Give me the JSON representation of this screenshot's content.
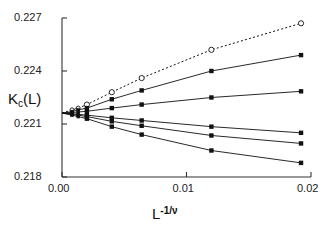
{
  "chart_data": {
    "type": "line",
    "title": "",
    "xlabel": "L^-1/nu",
    "ylabel": "Kc(L)",
    "xlim": [
      0.0,
      0.02
    ],
    "ylim": [
      0.218,
      0.227
    ],
    "xticks": [
      "0.00",
      "0.01",
      "0.02"
    ],
    "xtick_values": [
      0.0,
      0.01,
      0.02
    ],
    "yticks": [
      "0.218",
      "0.221",
      "0.224",
      "0.227"
    ],
    "ytick_values": [
      0.218,
      0.221,
      0.224,
      0.227
    ],
    "grid": false,
    "legend": "none",
    "series": [
      {
        "name": "series-1-dashed-open-circles",
        "marker": "open-circle",
        "linestyle": "dashed",
        "x": [
          0.0008,
          0.0013,
          0.002,
          0.004,
          0.0064,
          0.012,
          0.0192
        ],
        "y": [
          0.2218,
          0.2219,
          0.2221,
          0.2228,
          0.2236,
          0.2252,
          0.2267
        ]
      },
      {
        "name": "series-2-solid-filled-square",
        "marker": "filled-square",
        "linestyle": "solid",
        "x": [
          0.0008,
          0.0013,
          0.002,
          0.004,
          0.0064,
          0.012,
          0.0192
        ],
        "y": [
          0.2217,
          0.2218,
          0.2219,
          0.2224,
          0.2229,
          0.224,
          0.2249
        ]
      },
      {
        "name": "series-3-solid-filled-square",
        "marker": "filled-square",
        "linestyle": "solid",
        "x": [
          0.0008,
          0.0013,
          0.002,
          0.004,
          0.0064,
          0.012,
          0.0192
        ],
        "y": [
          0.22165,
          0.22168,
          0.22172,
          0.2219,
          0.2221,
          0.2225,
          0.22285
        ]
      },
      {
        "name": "series-4-solid-filled-square",
        "marker": "filled-square",
        "linestyle": "solid",
        "x": [
          0.0008,
          0.0013,
          0.002,
          0.004,
          0.0064,
          0.012,
          0.0192
        ],
        "y": [
          0.22158,
          0.22155,
          0.2215,
          0.22135,
          0.2212,
          0.22085,
          0.2205
        ]
      },
      {
        "name": "series-5-solid-filled-square",
        "marker": "filled-square",
        "linestyle": "solid",
        "x": [
          0.0008,
          0.0013,
          0.002,
          0.004,
          0.0064,
          0.012,
          0.0192
        ],
        "y": [
          0.22155,
          0.2215,
          0.22142,
          0.22115,
          0.2209,
          0.22035,
          0.2199
        ]
      },
      {
        "name": "series-6-solid-filled-square",
        "marker": "filled-square",
        "linestyle": "solid",
        "x": [
          0.0008,
          0.0013,
          0.002,
          0.004,
          0.0064,
          0.012,
          0.0192
        ],
        "y": [
          0.2215,
          0.22142,
          0.2213,
          0.22085,
          0.2204,
          0.2195,
          0.2188
        ]
      }
    ]
  },
  "axes": {
    "y_title_main": "K",
    "y_title_sub": "c",
    "y_title_tail": "(L)",
    "x_title_main": "L",
    "x_title_sup": "-1/ν",
    "ytick_labels": [
      "0.227",
      "0.224",
      "0.221",
      "0.218"
    ],
    "xtick_labels": [
      "0.00",
      "0.01",
      "0.02"
    ]
  }
}
